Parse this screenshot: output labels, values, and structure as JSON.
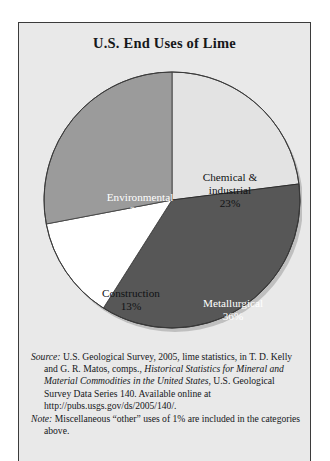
{
  "figure": {
    "title": "U.S. End Uses of Lime"
  },
  "chart_data": {
    "type": "pie",
    "title": "U.S. End Uses of Lime",
    "categories": [
      "Chemical & industrial",
      "Metallurgical",
      "Construction",
      "Environmental"
    ],
    "values": [
      23,
      36,
      13,
      28
    ],
    "unit": "percent",
    "start_angle_deg": 0,
    "direction": "clockwise",
    "legend": "none",
    "slice_label_position": "inside",
    "slices": [
      {
        "name": "Chemical & industrial",
        "label_line1": "Chemical &",
        "label_line2": "industrial",
        "value": 23,
        "value_label": "23%",
        "color": "#e3e3e3",
        "text_color": "#101214"
      },
      {
        "name": "Metallurgical",
        "label_line1": "Metallurgical",
        "label_line2": "",
        "value": 36,
        "value_label": "36%",
        "color": "#575757",
        "text_color": "#ffffff"
      },
      {
        "name": "Construction",
        "label_line1": "Construction",
        "label_line2": "",
        "value": 13,
        "value_label": "13%",
        "color": "#ffffff",
        "text_color": "#101214"
      },
      {
        "name": "Environmental",
        "label_line1": "Environmental",
        "label_line2": "",
        "value": 28,
        "value_label": "28%",
        "color": "#9b9b9b",
        "text_color": "#ffffff"
      }
    ]
  },
  "notes": {
    "source_lead": "Source:",
    "source_part1": " U.S. Geological Survey, 2005, lime statistics, in T. D. Kelly and G. R. Matos, comps., ",
    "source_italic1": "Historical Statistics for Mineral and Material Commodities in the United States",
    "source_part2": ", U.S. Geological Survey Data Series 140. Available online at http://pubs.usgs.gov/ds/2005/140/.",
    "note_lead": "Note:",
    "note_text": " Miscellaneous “other” uses of 1% are included in the categories above."
  }
}
